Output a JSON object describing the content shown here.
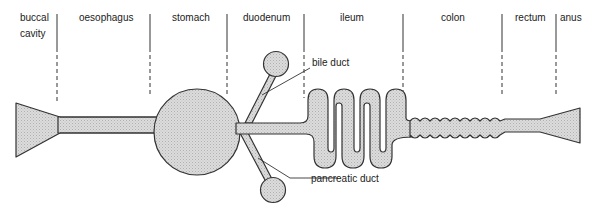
{
  "regions": [
    {
      "label": "buccal",
      "label2": "cavity"
    },
    {
      "label": "oesophagus"
    },
    {
      "label": "stomach"
    },
    {
      "label": "duodenum"
    },
    {
      "label": "ileum"
    },
    {
      "label": "colon"
    },
    {
      "label": "rectum"
    },
    {
      "label": "anus"
    }
  ],
  "annotations": {
    "bile_duct": "bile duct",
    "pancreatic_duct": "pancreatic duct"
  },
  "colors": {
    "fill": "#d4d4d4",
    "stroke": "#333333",
    "background": "#ffffff"
  }
}
